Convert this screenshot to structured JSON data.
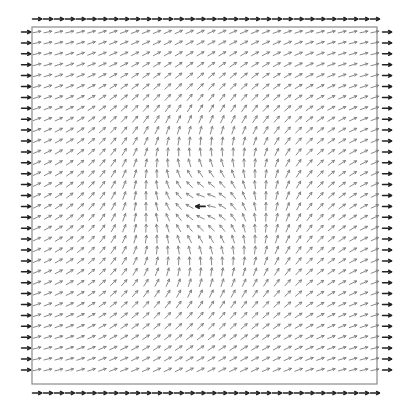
{
  "diagram": {
    "type": "vector_field",
    "title": "",
    "grid": {
      "columns": 32,
      "rows": 32,
      "origin_x": 37,
      "origin_y": 32,
      "pitch": 10.9
    },
    "frame": {
      "left": 32,
      "top": 27,
      "right": 377,
      "bottom": 384,
      "color": "#8a8a8a"
    },
    "center": {
      "x": 205,
      "y": 205
    },
    "field_model": {
      "description": "Direction angle rotates from 0 deg (right) far from center to 180 deg (left) at center; angle = 180 * exp(-r / L)",
      "decay_length_px": 86
    },
    "inner_arrow_color": "#7a7a7a",
    "center_arrow_color": "#222222",
    "boundary_arrow_color": "#222222",
    "boundary": {
      "top_row_y": 19,
      "bottom_row_y": 393,
      "left_col_x": 26,
      "right_col_x": 387,
      "direction": "right"
    },
    "center_arrow_direction": "left"
  }
}
